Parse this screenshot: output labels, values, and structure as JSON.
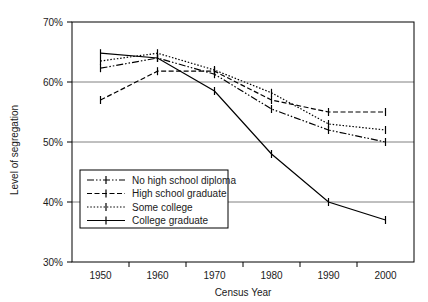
{
  "chart_data": {
    "type": "line",
    "title": "",
    "xlabel": "Census Year",
    "ylabel": "Level of segregation",
    "categories": [
      "1950",
      "1960",
      "1970",
      "1980",
      "1990",
      "2000"
    ],
    "x": [
      1950,
      1960,
      1970,
      1980,
      1990,
      2000
    ],
    "xlim": [
      1945,
      2005
    ],
    "ylim": [
      30,
      70
    ],
    "ytick_labels": [
      "70%",
      "60%",
      "50%",
      "40%",
      "30%"
    ],
    "ytick_values": [
      70,
      60,
      50,
      40,
      30
    ],
    "grid": "horizontal",
    "legend_position": "lower-left-inside",
    "series": [
      {
        "name": "No high school diploma",
        "style": "dash-dot-dot",
        "dasharray": "7,2,1.5,2,1.5,2",
        "marker": "bar",
        "values": [
          62.3,
          64.0,
          61.3,
          55.5,
          52.0,
          50.0
        ]
      },
      {
        "name": "High school graduate",
        "style": "dashed",
        "dasharray": "5,2.5",
        "marker": "bar",
        "values": [
          57.0,
          61.8,
          61.8,
          57.0,
          55.0,
          55.0
        ]
      },
      {
        "name": "Some college",
        "style": "dotted",
        "dasharray": "1.5,1.8",
        "marker": "bar",
        "values": [
          63.5,
          64.8,
          62.0,
          58.2,
          53.0,
          52.0
        ]
      },
      {
        "name": "College graduate",
        "style": "solid",
        "dasharray": "none",
        "marker": "bar",
        "values": [
          64.8,
          64.0,
          58.5,
          48.0,
          40.0,
          37.0
        ]
      }
    ]
  },
  "legend": {
    "entries": [
      {
        "label": "No high school diploma"
      },
      {
        "label": "High school graduate"
      },
      {
        "label": "Some college"
      },
      {
        "label": "College graduate"
      }
    ]
  },
  "axes": {
    "y_title": "Level of segregation",
    "x_title": "Census Year"
  },
  "colors": {
    "line": "#000000",
    "grid": "#808080",
    "frame": "#000000",
    "background": "#ffffff",
    "text": "#1a1a1a"
  }
}
